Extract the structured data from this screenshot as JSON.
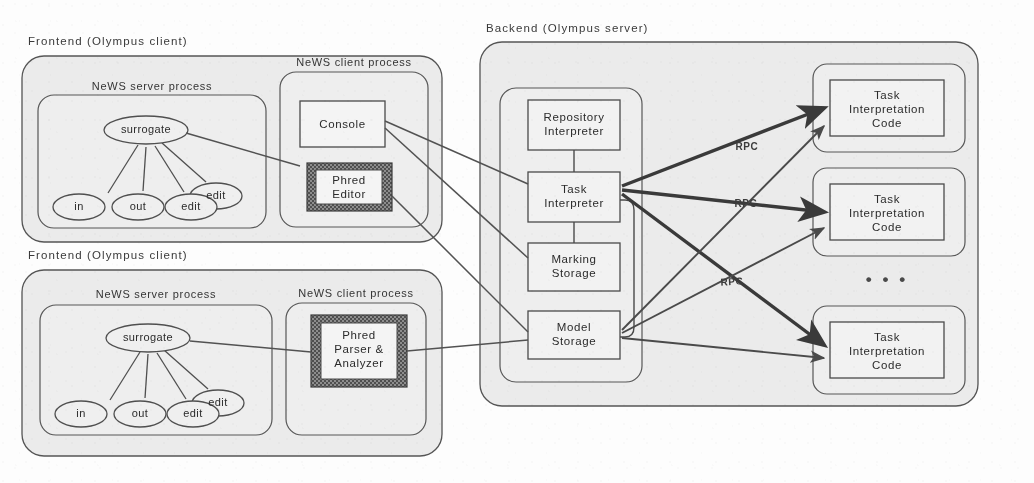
{
  "diagram": {
    "title_text": "Olympus client-server architecture",
    "style": {
      "panel_fill": "#ebebeb",
      "group_fill": "#eeeeee",
      "box_fill": "#f2f2f2",
      "stroke": "#4a4a4a",
      "thick_stroke": "#3a3a3a",
      "hatch_dark": "#555555",
      "page_bg": "#fdfdfd"
    },
    "panels": [
      {
        "id": "frontend-top",
        "label": "Frontend (Olympus client)"
      },
      {
        "id": "frontend-bottom",
        "label": "Frontend (Olympus client)"
      },
      {
        "id": "backend",
        "label": "Backend (Olympus server)"
      }
    ],
    "groups": [
      {
        "id": "news-server-top",
        "label": "NeWS server process"
      },
      {
        "id": "news-client-top",
        "label": "NeWS client process"
      },
      {
        "id": "news-server-bottom",
        "label": "NeWS server process"
      },
      {
        "id": "news-client-bottom",
        "label": "NeWS client process"
      }
    ],
    "frontend_top": {
      "panel_label": "Frontend (Olympus client)",
      "server_group_label": "NeWS server process",
      "client_group_label": "NeWS client process",
      "surrogate_node": "surrogate",
      "child_nodes": [
        "in",
        "out",
        "edit",
        "edit"
      ],
      "boxes": [
        {
          "id": "console",
          "label": "Console",
          "shaded": false
        },
        {
          "id": "phred-editor",
          "label": "Phred\nEditor",
          "shaded": true
        }
      ]
    },
    "frontend_bottom": {
      "panel_label": "Frontend (Olympus client)",
      "server_group_label": "NeWS server process",
      "client_group_label": "NeWS client process",
      "surrogate_node": "surrogate",
      "child_nodes": [
        "in",
        "out",
        "edit",
        "edit"
      ],
      "boxes": [
        {
          "id": "phred-parser",
          "label": "Phred\nParser &\nAnalyzer",
          "shaded": true
        }
      ]
    },
    "backend": {
      "panel_label": "Backend (Olympus server)",
      "boxes": [
        {
          "id": "repository-interpreter",
          "label": "Repository\nInterpreter"
        },
        {
          "id": "task-interpreter",
          "label": "Task\nInterpreter"
        },
        {
          "id": "marking-storage",
          "label": "Marking\nStorage"
        },
        {
          "id": "model-storage",
          "label": "Model\nStorage"
        }
      ],
      "task_code_boxes": [
        {
          "id": "tic-1",
          "label": "Task\nInterpretation\nCode"
        },
        {
          "id": "tic-2",
          "label": "Task\nInterpretation\nCode"
        },
        {
          "id": "tic-3",
          "label": "Task\nInterpretation\nCode"
        }
      ],
      "ellipsis": "• • •"
    },
    "edge_labels": [
      {
        "id": "rpc-1",
        "text": "RPC",
        "x": 738,
        "y": 148
      },
      {
        "id": "rpc-2",
        "text": "RPC",
        "x": 737,
        "y": 205
      },
      {
        "id": "rpc-3",
        "text": "RPC",
        "x": 723,
        "y": 283
      }
    ]
  }
}
